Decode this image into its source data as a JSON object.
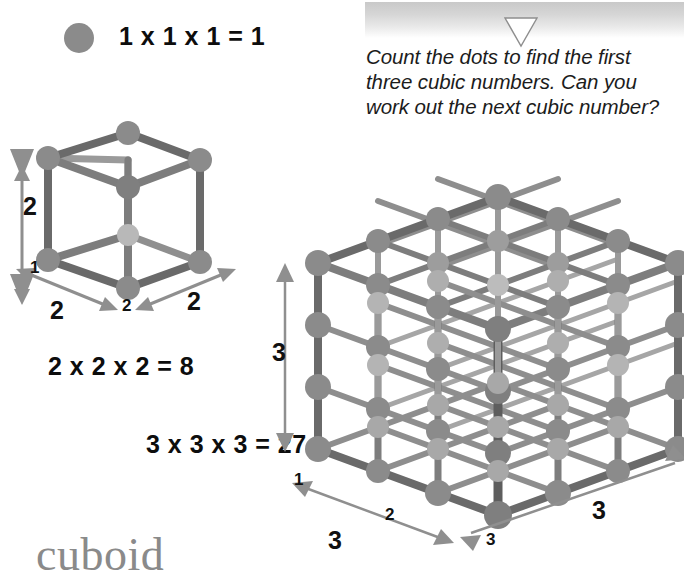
{
  "banner": {
    "triangle_icon": "triangle-down-icon"
  },
  "instruction": {
    "text": "Count the dots to find the first three cubic numbers. Can you work out the next cubic number?"
  },
  "legend": {
    "dot_icon": "single-dot-icon",
    "equation": "1 x 1 x 1 = 1"
  },
  "equations": {
    "cube2": "2 x 2 x 2 = 8",
    "cube3": "3 x 3 x 3 = 27"
  },
  "cube2_labels": {
    "height": "2",
    "front_left_small": "1",
    "front_left_big": "2",
    "front_mid_small": "2",
    "front_right_big": "2"
  },
  "cube3_labels": {
    "height": "3",
    "front_left_small": "1",
    "front_mid_small": "2",
    "front_right_small": "3",
    "front_left_big": "3",
    "front_right_big": "3"
  },
  "footer": {
    "word": "cuboid"
  },
  "colors": {
    "dot": "#8b8b8b",
    "dot_light": "#b4b4b4",
    "edge_dark": "#6a6a6a",
    "edge_mid": "#7d7d7d",
    "edge_light": "#9a9a9a",
    "arrow": "#8f8f8f",
    "text": "#111111",
    "cuboid_word": "#8a8a8a",
    "banner_top": "#c9c9c9"
  }
}
